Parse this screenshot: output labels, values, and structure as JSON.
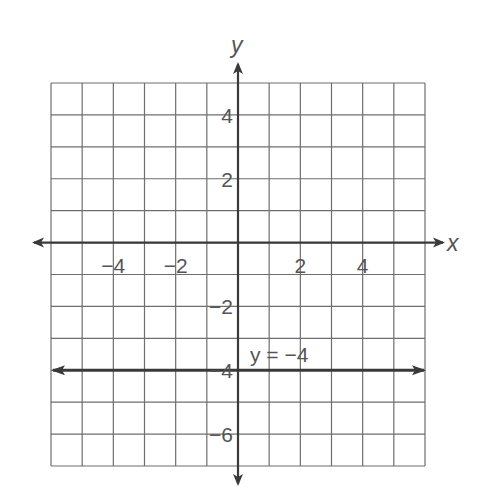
{
  "chart_data": {
    "type": "line",
    "title": "",
    "xlabel": "x",
    "ylabel": "y",
    "xlim": [
      -6,
      6
    ],
    "ylim": [
      -7,
      5
    ],
    "grid": true,
    "grid_step": 1,
    "x_ticks": [
      -4,
      -2,
      2,
      4
    ],
    "x_tick_labels": [
      "−4",
      "−2",
      "2",
      "4"
    ],
    "y_ticks": [
      4,
      2,
      -2,
      -4,
      -6
    ],
    "y_tick_labels": [
      "4",
      "2",
      "−2",
      "−4",
      "−6"
    ],
    "series": [
      {
        "name": "y = −4",
        "equation": "y = -4",
        "x": [
          -6,
          6
        ],
        "y": [
          -4,
          -4
        ],
        "arrows_both_ends": true
      }
    ],
    "annotations": [
      {
        "text": "y = −4",
        "x": 0.4,
        "y": -3.6
      }
    ],
    "legend": "none"
  },
  "colors": {
    "grid": "#6e6e6e",
    "axis": "#3a3a3a",
    "line": "#3a3a3a",
    "text": "#555555",
    "background": "#ffffff"
  },
  "labels": {
    "x_axis": "x",
    "y_axis": "y",
    "line_annotation": "y = −4"
  }
}
